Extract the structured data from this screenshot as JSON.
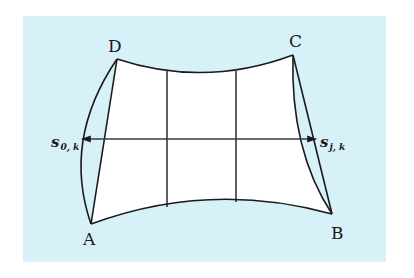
{
  "diagram": {
    "background_color": "#d6f1f8",
    "line_color": "#1a1a1a",
    "fill_color": "#ffffff",
    "corners": {
      "A": {
        "label": "A",
        "x": 91,
        "y": 224
      },
      "B": {
        "label": "B",
        "x": 332,
        "y": 214
      },
      "C": {
        "label": "C",
        "x": 293,
        "y": 55
      },
      "D": {
        "label": "D",
        "x": 117,
        "y": 59
      }
    },
    "left_vector": {
      "symbol": "s",
      "subscript": "0, k"
    },
    "right_vector": {
      "symbol": "s",
      "subscript": "j, k"
    },
    "interior_grid": {
      "vertical_lines": 2,
      "horizontal_arrow": "double-headed"
    }
  }
}
